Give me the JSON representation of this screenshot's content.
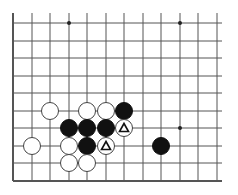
{
  "board": {
    "cols_x": [
      13,
      32,
      50,
      69,
      87,
      106,
      124,
      143,
      161,
      180,
      198,
      217
    ],
    "rows_y": [
      23,
      41,
      58,
      76,
      93,
      111,
      128,
      146,
      163,
      181
    ],
    "edges": {
      "left": true,
      "bottom": true
    },
    "line_color": "#555555",
    "hoshi": [
      [
        3,
        0
      ],
      [
        9,
        0
      ],
      [
        9,
        6
      ]
    ],
    "stones": [
      {
        "c": 2,
        "r": 5,
        "color": "white"
      },
      {
        "c": 4,
        "r": 5,
        "color": "white"
      },
      {
        "c": 5,
        "r": 5,
        "color": "white"
      },
      {
        "c": 6,
        "r": 5,
        "color": "black"
      },
      {
        "c": 3,
        "r": 6,
        "color": "black"
      },
      {
        "c": 4,
        "r": 6,
        "color": "black"
      },
      {
        "c": 5,
        "r": 6,
        "color": "black"
      },
      {
        "c": 6,
        "r": 6,
        "color": "white",
        "mark": "triangle"
      },
      {
        "c": 1,
        "r": 7,
        "color": "white"
      },
      {
        "c": 3,
        "r": 7,
        "color": "white"
      },
      {
        "c": 4,
        "r": 7,
        "color": "black"
      },
      {
        "c": 5,
        "r": 7,
        "color": "white",
        "mark": "triangle"
      },
      {
        "c": 8,
        "r": 7,
        "color": "black"
      },
      {
        "c": 3,
        "r": 8,
        "color": "white"
      },
      {
        "c": 4,
        "r": 8,
        "color": "white"
      }
    ]
  }
}
